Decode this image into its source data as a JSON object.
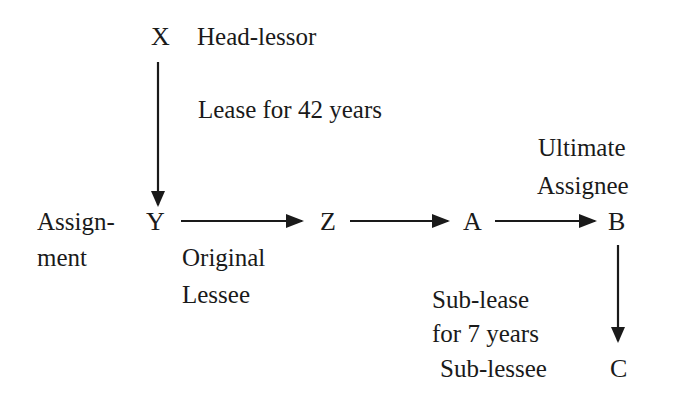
{
  "nodes": {
    "x": "X",
    "y": "Y",
    "z": "Z",
    "a": "A",
    "b": "B",
    "c": "C"
  },
  "labels": {
    "head_lessor": "Head-lessor",
    "lease_term": "Lease for 42 years",
    "assignment_line1": "Assign-",
    "assignment_line2": "ment",
    "original_lessee_line1": "Original",
    "original_lessee_line2": "Lessee",
    "ultimate_assignee_line1": "Ultimate",
    "ultimate_assignee_line2": "Assignee",
    "sub_lease_line1": "Sub-lease",
    "sub_lease_line2": "for 7 years",
    "sub_lessee": "Sub-lessee"
  },
  "edges": [
    {
      "from": "X",
      "to": "Y",
      "label": "Lease for 42 years"
    },
    {
      "from": "Y",
      "to": "Z",
      "label": "Assignment"
    },
    {
      "from": "Z",
      "to": "A",
      "label": ""
    },
    {
      "from": "A",
      "to": "B",
      "label": ""
    },
    {
      "from": "B",
      "to": "C",
      "label": "Sub-lease for 7 years"
    }
  ],
  "colors": {
    "ink": "#1a1a1a",
    "background": "#ffffff"
  }
}
